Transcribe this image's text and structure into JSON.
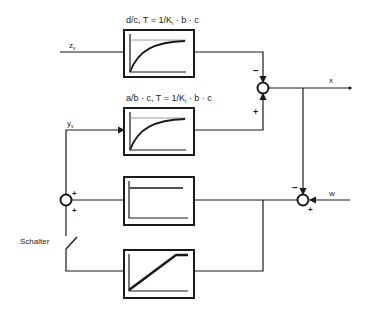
{
  "diagram": {
    "type": "block-diagram",
    "blocks": [
      {
        "id": "block-1",
        "label": "d/c, T = 1/K",
        "label_sub": "i",
        "label_rest": " · b · c",
        "response": "first-order-lag"
      },
      {
        "id": "block-2",
        "label": "a/b · c, T = 1/K",
        "label_sub": "i",
        "label_rest": " · b · c",
        "response": "first-order-lag"
      },
      {
        "id": "block-3",
        "label": "",
        "response": "step-proportional"
      },
      {
        "id": "block-4",
        "label": "",
        "response": "ramp-saturation"
      }
    ],
    "inputs": {
      "z": {
        "main": "z",
        "sub": "v"
      },
      "y": {
        "main": "y",
        "sub": "v"
      }
    },
    "outputs": {
      "x": "x",
      "w": "w"
    },
    "switch_label": "Schalter",
    "signs": {
      "sum1_top": "–",
      "sum1_bottom": "+",
      "sum2_top": "–",
      "sum2_bottom": "+",
      "sum3_top": "+",
      "sum3_bottom": "+"
    }
  }
}
